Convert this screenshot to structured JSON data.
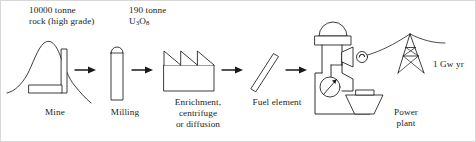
{
  "figure": {
    "type": "process-flow",
    "stroke_color": "#1a1a1a",
    "background_color": "#ffffff",
    "arrow_count": 4
  },
  "inputs": {
    "ore": {
      "line1": "10000 tonne",
      "line2": "rock (high grade)"
    },
    "yellowcake": {
      "line1": "190 tonne",
      "formula_u": "U",
      "formula_sub3": "3",
      "formula_o": "O",
      "formula_sub8": "8"
    }
  },
  "stages": [
    {
      "id": "mine",
      "label": "Mine",
      "icon": "mountain-mine-shaft-icon"
    },
    {
      "id": "milling",
      "label": "Milling",
      "icon": "mill-tube-icon"
    },
    {
      "id": "enrichment",
      "label": "Enrichment, centrifuge or diffusion",
      "label_line1": "Enrichment,",
      "label_line2": "centrifuge",
      "label_line3": "or diffusion",
      "icon": "sawtooth-factory-icon"
    },
    {
      "id": "fuel",
      "label": "Fuel element",
      "icon": "fuel-rod-icon"
    },
    {
      "id": "power",
      "label": "Power plant",
      "label_line1": "Power",
      "label_line2": "plant",
      "icon": "nuclear-power-plant-icon"
    }
  ],
  "output": {
    "label": "1 Gw yr",
    "icon": "transmission-pylon-icon"
  }
}
